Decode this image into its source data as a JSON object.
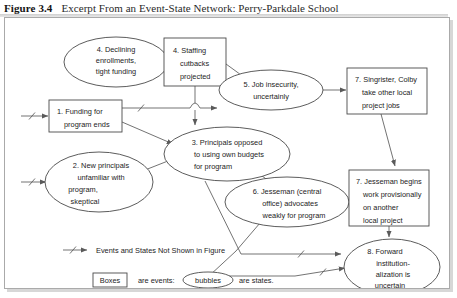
{
  "caption": {
    "figure_number": "Figure 3.4",
    "title": "Excerpt From an Event-State Network: Perry-Parkdale School"
  },
  "diagram": {
    "type": "event-state-network",
    "nodes": [
      {
        "id": "n4a",
        "shape": "bubble",
        "number": "4.",
        "lines": [
          "4. Declining",
          "enrollments,",
          "tight funding"
        ],
        "cx": 111,
        "cy": 44,
        "rx": 52,
        "ry": 25
      },
      {
        "id": "n4b",
        "shape": "box",
        "number": "4.",
        "lines": [
          "4. Staffing",
          "cutbacks",
          "projected"
        ],
        "x": 159,
        "y": 20,
        "w": 62,
        "h": 48
      },
      {
        "id": "n5",
        "shape": "bubble",
        "number": "5.",
        "lines": [
          "5. Job insecurity,",
          "uncertainly"
        ],
        "cx": 266,
        "cy": 72,
        "rx": 52,
        "ry": 20
      },
      {
        "id": "n7a",
        "shape": "box",
        "number": "7.",
        "lines": [
          "7. Singrister, Colby",
          "take other local",
          "project jobs"
        ],
        "x": 342,
        "y": 50,
        "w": 80,
        "h": 46
      },
      {
        "id": "n1",
        "shape": "box",
        "number": "1.",
        "lines": [
          "1. Funding for",
          "program ends"
        ],
        "x": 44,
        "y": 82,
        "w": 73,
        "h": 32
      },
      {
        "id": "n3",
        "shape": "bubble",
        "number": "3.",
        "lines": [
          "3. Principals opposed",
          "to using own budgets",
          "for program"
        ],
        "cx": 222,
        "cy": 136,
        "rx": 63,
        "ry": 27
      },
      {
        "id": "n2",
        "shape": "bubble",
        "number": "2.",
        "lines": [
          "2. New principals",
          "unfamiliar with",
          "program,",
          "skeptical"
        ],
        "cx": 94,
        "cy": 164,
        "rx": 54,
        "ry": 30
      },
      {
        "id": "n6",
        "shape": "bubble",
        "number": "6.",
        "lines": [
          "6. Jesseman (central",
          "office) advocates",
          "weakly for program"
        ],
        "cx": 282,
        "cy": 184,
        "rx": 62,
        "ry": 25
      },
      {
        "id": "n7b",
        "shape": "box",
        "number": "7.",
        "lines": [
          "7. Jesseman begins",
          "work provisionally",
          "on another",
          "local project"
        ],
        "x": 344,
        "y": 152,
        "w": 80,
        "h": 56
      },
      {
        "id": "n8",
        "shape": "bubble",
        "number": "8.",
        "lines": [
          "8. Forward",
          "institution-",
          "alization is",
          "uncertain"
        ],
        "cx": 387,
        "cy": 249,
        "rx": 48,
        "ry": 28
      }
    ],
    "edges": [
      {
        "from": "offpage",
        "to": "n1",
        "hatched": true
      },
      {
        "from": "offpage",
        "to": "n2",
        "hatched": true
      },
      {
        "from": "n4a",
        "to": "n4b",
        "hatched": false
      },
      {
        "from": "n4b",
        "to": "n5",
        "hatched": false
      },
      {
        "from": "n4b",
        "to": "n3",
        "hatched": false
      },
      {
        "from": "n1",
        "to": "n5",
        "hatched": true
      },
      {
        "from": "n1",
        "to": "n3",
        "hatched": false
      },
      {
        "from": "n2",
        "to": "n3",
        "hatched": false
      },
      {
        "from": "n5",
        "to": "n7a",
        "hatched": false
      },
      {
        "from": "n3",
        "to": "n6",
        "hatched": false
      },
      {
        "from": "n6",
        "to": "n7b",
        "hatched": false
      },
      {
        "from": "n7a",
        "to": "n7b",
        "hatched": false
      },
      {
        "from": "n3",
        "to": "n8",
        "hatched": true
      },
      {
        "from": "n6",
        "to": "n8",
        "hatched": true
      },
      {
        "from": "n7b",
        "to": "n8",
        "hatched": false
      }
    ]
  },
  "legend": {
    "line1": "Events and States Not Shown in Figure",
    "line2_a": "Boxes",
    "line2_b": "are events:",
    "line2_c": "bubbles",
    "line2_d": "are states."
  },
  "colors": {
    "ink": "#1c1c1c",
    "stroke": "#4a4a4a",
    "edge": "#5a5a5a",
    "frame": "#aaaaaa",
    "shadow": "#d7d7d7",
    "background": "#ffffff"
  }
}
